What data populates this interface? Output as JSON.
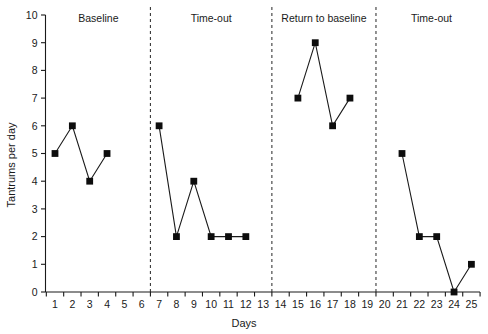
{
  "chart_data": {
    "type": "line",
    "title": "",
    "xlabel": "Days",
    "ylabel": "Tantrums per day",
    "xlim": [
      0,
      26
    ],
    "ylim": [
      0,
      10
    ],
    "grid": false,
    "legend": "none",
    "x_ticks": [
      1,
      2,
      3,
      4,
      5,
      6,
      7,
      8,
      9,
      10,
      11,
      12,
      13,
      14,
      15,
      16,
      17,
      18,
      19,
      20,
      21,
      22,
      23,
      24,
      25
    ],
    "y_ticks": [
      0,
      1,
      2,
      3,
      4,
      5,
      6,
      7,
      8,
      9,
      10
    ],
    "phases": [
      {
        "label": "Baseline",
        "x_start": 1,
        "x_end": 6,
        "label_x": 3.5
      },
      {
        "label": "Time-out",
        "x_start": 7,
        "x_end": 13,
        "label_x": 10.0
      },
      {
        "label": "Return to baseline",
        "x_start": 14,
        "x_end": 19,
        "label_x": 16.5
      },
      {
        "label": "Time-out",
        "x_start": 20,
        "x_end": 25,
        "label_x": 22.7
      }
    ],
    "phase_dividers": [
      6.5,
      13.5,
      19.5
    ],
    "series": [
      {
        "name": "Tantrums per day",
        "segments": [
          {
            "phase": "Baseline",
            "x": [
              1,
              2,
              3,
              4
            ],
            "values": [
              5,
              6,
              4,
              5
            ]
          },
          {
            "phase": "Time-out",
            "x": [
              7,
              8,
              9,
              10,
              11,
              12
            ],
            "values": [
              6,
              2,
              4,
              2,
              2,
              2
            ]
          },
          {
            "phase": "Return to baseline",
            "x": [
              15,
              16,
              17,
              18
            ],
            "values": [
              7,
              9,
              6,
              7
            ]
          },
          {
            "phase": "Time-out",
            "x": [
              21,
              22,
              23,
              24,
              25
            ],
            "values": [
              5,
              2,
              2,
              0,
              1
            ]
          }
        ]
      }
    ],
    "marker_color": "#0d0d0d",
    "line_color": "#1a1a1a",
    "divider_color": "#3a3a3a"
  }
}
